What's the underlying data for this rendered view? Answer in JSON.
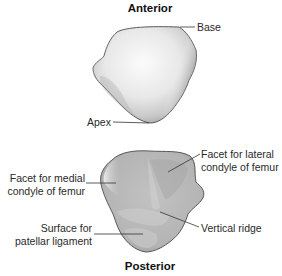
{
  "figure": {
    "views": [
      {
        "name": "anterior",
        "title": "Anterior",
        "labels": [
          {
            "id": "base",
            "text": "Base"
          },
          {
            "id": "apex",
            "text": "Apex"
          }
        ]
      },
      {
        "name": "posterior",
        "title": "Posterior",
        "labels": [
          {
            "id": "facet-medial",
            "lines": [
              "Facet for medial",
              "condyle of femur"
            ]
          },
          {
            "id": "facet-lateral",
            "lines": [
              "Facet for lateral",
              "condyle of femur"
            ]
          },
          {
            "id": "surface-patellar",
            "lines": [
              "Surface for",
              "patellar ligament"
            ]
          },
          {
            "id": "vertical-ridge",
            "text": "Vertical ridge"
          }
        ]
      }
    ],
    "colors": {
      "bone_light": "#f4f4f4",
      "bone_mid": "#d6d6d6",
      "bone_dark": "#9a9a9a",
      "posterior_fill": "#bdbdbd",
      "outline": "#4a4a4a",
      "leader": "#333333",
      "text": "#2a2a2a"
    }
  }
}
